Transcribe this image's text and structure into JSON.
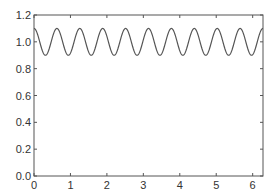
{
  "chart_data": {
    "type": "line",
    "title": "",
    "xlabel": "",
    "ylabel": "",
    "xlim": [
      0,
      6.2832
    ],
    "ylim": [
      0,
      1.2
    ],
    "xticks": [
      0,
      1,
      2,
      3,
      4,
      5,
      6
    ],
    "xtick_labels": [
      "0",
      "1",
      "2",
      "3",
      "4",
      "5",
      "6"
    ],
    "yticks": [
      0.0,
      0.2,
      0.4,
      0.6,
      0.8,
      1.0,
      1.2
    ],
    "ytick_labels": [
      "0.0",
      "0.2",
      "0.4",
      "0.6",
      "0.8",
      "1.0",
      "1.2"
    ],
    "grid": false,
    "legend": null,
    "series": [
      {
        "name": "y = 1 + 0.1·cos(10x)",
        "function": {
          "offset": 1.0,
          "amplitude": 0.1,
          "frequency": 10,
          "phase": 0
        },
        "color": "#555555"
      }
    ]
  }
}
